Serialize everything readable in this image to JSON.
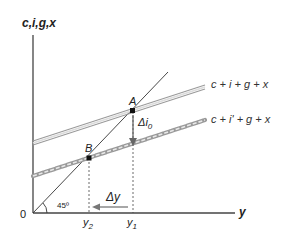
{
  "axes": {
    "y_label": "c,i,g,x",
    "x_label": "y",
    "origin_label": "0",
    "angle_label": "45º"
  },
  "curves": {
    "upper": "c + i + g + x",
    "lower": "c + i' + g + x",
    "diagonal": "45-degree line"
  },
  "points": {
    "a": "A",
    "b": "B"
  },
  "annotations": {
    "delta_i": "Δi",
    "delta_i_sub": "0",
    "delta_y": "Δy"
  },
  "ticks": {
    "y1": "y",
    "y1_sub": "1",
    "y2": "y",
    "y2_sub": "2"
  },
  "colors": {
    "axis": "#444444",
    "upper_curve": "#9a9a9a",
    "lower_curve": "#9a9a9a",
    "point": "#111111"
  }
}
